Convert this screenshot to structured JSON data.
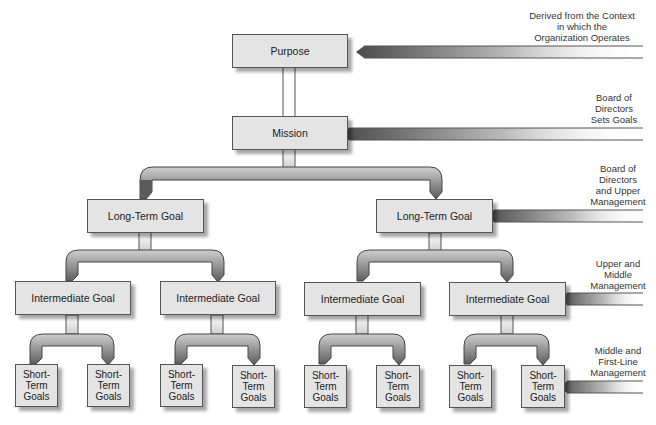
{
  "diagram": {
    "nodes": {
      "purpose": "Purpose",
      "mission": "Mission",
      "long_term_goal": "Long-Term Goal",
      "intermediate_goal": "Intermediate Goal",
      "short_term_line1": "Short-",
      "short_term_line2": "Term",
      "short_term_line3": "Goals"
    },
    "side_labels": {
      "purpose": [
        "Derived from the Context",
        "in which the",
        "Organization Operates"
      ],
      "mission": [
        "Board of",
        "Directors",
        "Sets Goals"
      ],
      "long_term": [
        "Board of",
        "Directors",
        "and Upper",
        "Management"
      ],
      "intermediate": [
        "Upper and",
        "Middle",
        "Management"
      ],
      "short_term": [
        "Middle and",
        "First-Line",
        "Management"
      ]
    },
    "colors": {
      "box_fill": "#e4e4e4",
      "box_border": "#555555",
      "arrow_dark": "#555555",
      "arrow_light": "#dddddd"
    }
  }
}
